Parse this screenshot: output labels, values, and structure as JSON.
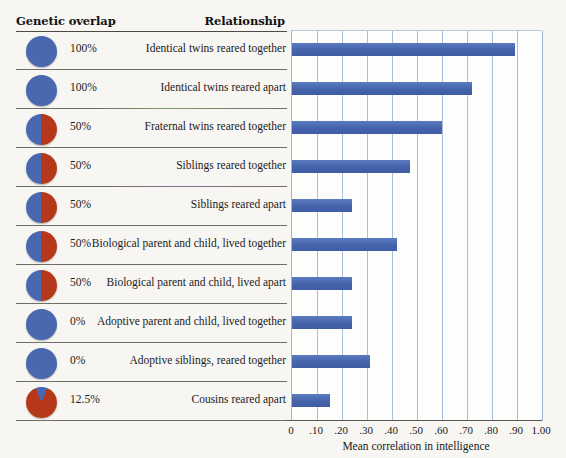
{
  "table": {
    "headers": {
      "genetic_overlap": "Genetic overlap",
      "relationship": "Relationship"
    },
    "rows": [
      {
        "percent": "100%",
        "relationship": "Identical twins reared together",
        "blue_fraction": 1.0
      },
      {
        "percent": "100%",
        "relationship": "Identical twins reared apart",
        "blue_fraction": 1.0
      },
      {
        "percent": "50%",
        "relationship": "Fraternal twins reared together",
        "blue_fraction": 0.5
      },
      {
        "percent": "50%",
        "relationship": "Siblings reared together",
        "blue_fraction": 0.5
      },
      {
        "percent": "50%",
        "relationship": "Siblings reared apart",
        "blue_fraction": 0.5
      },
      {
        "percent": "50%",
        "relationship": "Biological parent and child, lived together",
        "blue_fraction": 0.5
      },
      {
        "percent": "50%",
        "relationship": "Biological parent and child, lived apart",
        "blue_fraction": 0.5
      },
      {
        "percent": "0%",
        "relationship": "Adoptive parent and child, lived together",
        "blue_fraction": 1.0
      },
      {
        "percent": "0%",
        "relationship": "Adoptive siblings, reared together",
        "blue_fraction": 1.0
      },
      {
        "percent": "12.5%",
        "relationship": "Cousins reared apart",
        "blue_fraction": 0.125
      }
    ]
  },
  "colors": {
    "bar_blue": "#4a6cb3",
    "pie_blue": "#4a68b0",
    "pie_red": "#b5381a",
    "gridline": "#a8bed9",
    "axis": "#5c5a55",
    "background": "#f7f6f2"
  },
  "chart_data": {
    "type": "bar",
    "orientation": "horizontal",
    "title": "",
    "xlabel": "Mean correlation in intelligence",
    "ylabel": "",
    "xlim": [
      0,
      1.0
    ],
    "grid": true,
    "legend": null,
    "tick_labels": [
      "0",
      ".10",
      ".20",
      ".30",
      ".40",
      ".50",
      ".60",
      ".70",
      ".80",
      ".90",
      "1.00"
    ],
    "tick_values": [
      0,
      0.1,
      0.2,
      0.3,
      0.4,
      0.5,
      0.6,
      0.7,
      0.8,
      0.9,
      1.0
    ],
    "categories": [
      "Identical twins reared together",
      "Identical twins reared apart",
      "Fraternal twins reared together",
      "Siblings reared together",
      "Siblings reared apart",
      "Biological parent and child, lived together",
      "Biological parent and child, lived apart",
      "Adoptive parent and child, lived together",
      "Adoptive siblings, reared together",
      "Cousins reared apart"
    ],
    "values": [
      0.89,
      0.72,
      0.6,
      0.47,
      0.24,
      0.42,
      0.24,
      0.24,
      0.31,
      0.15
    ]
  }
}
